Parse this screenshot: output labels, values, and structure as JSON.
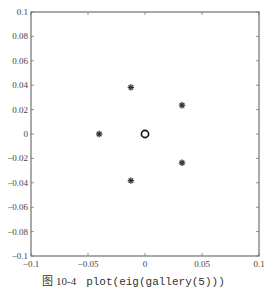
{
  "chart_data": {
    "type": "scatter",
    "title": "",
    "xlabel": "",
    "ylabel": "",
    "xlim": [
      -0.1,
      0.1
    ],
    "ylim": [
      -0.1,
      0.1
    ],
    "grid": false,
    "legend": null,
    "x_ticks": [
      -0.1,
      -0.05,
      0,
      0.05,
      0.1
    ],
    "x_tick_labels": [
      "-0.1",
      "-0.05",
      "0",
      "0.05",
      "0.1"
    ],
    "y_ticks": [
      0.1,
      0.08,
      0.06,
      0.04,
      0.02,
      0,
      -0.02,
      -0.04,
      -0.06,
      -0.08,
      -0.1
    ],
    "y_tick_labels": [
      "0.1",
      "0.08",
      "0.06",
      "0.04",
      "0.02",
      "0",
      "-0.02",
      "-0.04",
      "-0.06",
      "-0.08",
      "-0.1"
    ],
    "series": [
      {
        "name": "eig(gallery(5))",
        "marker": "asterisk",
        "points": [
          {
            "x": -0.0124,
            "y": 0.0382
          },
          {
            "x": 0.0325,
            "y": 0.0236
          },
          {
            "x": -0.0402,
            "y": 0.0
          },
          {
            "x": 0.0325,
            "y": -0.0236
          },
          {
            "x": -0.0124,
            "y": -0.0382
          }
        ]
      },
      {
        "name": "origin",
        "marker": "circle",
        "points": [
          {
            "x": 0,
            "y": 0
          }
        ]
      }
    ]
  },
  "caption": {
    "figure_number": "图 10-4",
    "code": "plot(eig(gallery(5)))"
  }
}
